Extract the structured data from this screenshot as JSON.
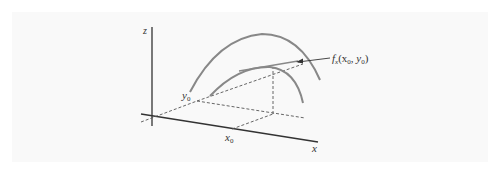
{
  "figure": {
    "title": "",
    "labels": {
      "z_axis": "z",
      "x_axis": "x",
      "x0": "x",
      "x0_sub": "0",
      "y0": "y",
      "y0_sub": "0",
      "annotation_f": "f",
      "annotation_sub": "x",
      "annotation_args": "(x",
      "annotation_args_sub1": "0",
      "annotation_comma": ", y",
      "annotation_args_sub2": "0",
      "annotation_close": ")"
    },
    "colors": {
      "panel": "#f9f9f9",
      "axis": "#333333",
      "curve": "#888888",
      "dashed": "#555555"
    }
  }
}
